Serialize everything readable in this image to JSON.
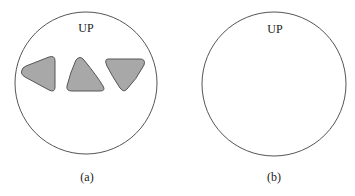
{
  "panels": [
    {
      "id": "a",
      "orientation_label": "UP",
      "caption": "(a)",
      "circle": {
        "cx": 86,
        "cy": 83,
        "r": 71
      },
      "shapes": [
        {
          "name": "rounded-triangle-left",
          "fill": "#a8a8a8"
        },
        {
          "name": "rounded-triangle-up",
          "fill": "#a8a8a8"
        },
        {
          "name": "rounded-triangle-down",
          "fill": "#a8a8a8"
        }
      ]
    },
    {
      "id": "b",
      "orientation_label": "UP",
      "caption": "(b)",
      "circle": {
        "cx": 274,
        "cy": 84,
        "r": 72
      },
      "shapes": []
    }
  ],
  "colors": {
    "stroke": "#555555",
    "shape_fill": "#a8a8a8",
    "background": "#ffffff"
  }
}
